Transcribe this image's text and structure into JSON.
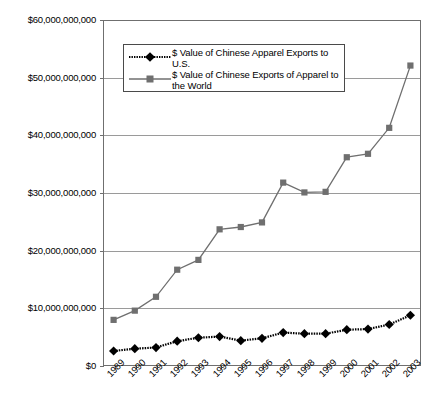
{
  "chart_data": {
    "type": "line",
    "title": "",
    "xlabel": "",
    "ylabel": "",
    "categories": [
      "1989",
      "1990",
      "1991",
      "1992",
      "1993",
      "1994",
      "1995",
      "1996",
      "1997",
      "1998",
      "1999",
      "2000",
      "2001",
      "2002",
      "2003"
    ],
    "ylim": [
      0,
      60000000000
    ],
    "ytick_labels": [
      "$0",
      "$10,000,000,000",
      "$20,000,000,000",
      "$30,000,000,000",
      "$40,000,000,000",
      "$50,000,000,000",
      "$60,000,000,000"
    ],
    "ytick_values": [
      0,
      10000000000,
      20000000000,
      30000000000,
      40000000000,
      50000000000,
      60000000000
    ],
    "grid": true,
    "legend_position": "upper-left-inside",
    "series": [
      {
        "name": "$ Value of Chinese Apparel Exports to U.S.",
        "marker": "diamond",
        "color": "#000000",
        "values": [
          2600000000,
          3000000000,
          3200000000,
          4300000000,
          4900000000,
          5100000000,
          4400000000,
          4800000000,
          5800000000,
          5600000000,
          5600000000,
          6300000000,
          6400000000,
          7200000000,
          8800000000
        ]
      },
      {
        "name": "$ Value of Chinese Exports of Apparel to the World",
        "marker": "square",
        "color": "#6f6f6f",
        "values": [
          8000000000,
          9600000000,
          12000000000,
          16700000000,
          18400000000,
          23700000000,
          24100000000,
          24900000000,
          31800000000,
          30100000000,
          30200000000,
          36200000000,
          36800000000,
          41300000000,
          52100000000
        ]
      }
    ]
  },
  "legend": {
    "entries": [
      {
        "label": "$ Value of Chinese Apparel Exports to\nU.S.",
        "key": "diamond-line-key"
      },
      {
        "label": "$ Value of Chinese Exports of Apparel to\nthe World",
        "key": "square-line-key"
      }
    ]
  },
  "colors": {
    "series_us": "#000000",
    "series_world": "#6f6f6f",
    "gridline": "#9a9a9a",
    "frame": "#6f6f6f",
    "background": "#ffffff"
  }
}
